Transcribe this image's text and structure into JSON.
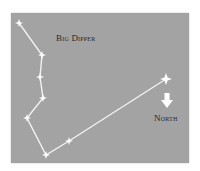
{
  "diagram": {
    "title_label": "Big Dipper",
    "north_label": "North",
    "colors": {
      "background": "#a3a3a3",
      "line": "#f2f2f2",
      "star": "#ffffff",
      "text": "#2a2a2a"
    },
    "stars": [
      {
        "x": 19,
        "y": 23
      },
      {
        "x": 42,
        "y": 55
      },
      {
        "x": 40,
        "y": 77
      },
      {
        "x": 43,
        "y": 98
      },
      {
        "x": 27,
        "y": 118
      },
      {
        "x": 46,
        "y": 155
      },
      {
        "x": 69,
        "y": 141
      },
      {
        "x": 166,
        "y": 79
      }
    ],
    "north_star": {
      "x": 166,
      "y": 79
    },
    "arrow": {
      "direction": "down"
    }
  }
}
